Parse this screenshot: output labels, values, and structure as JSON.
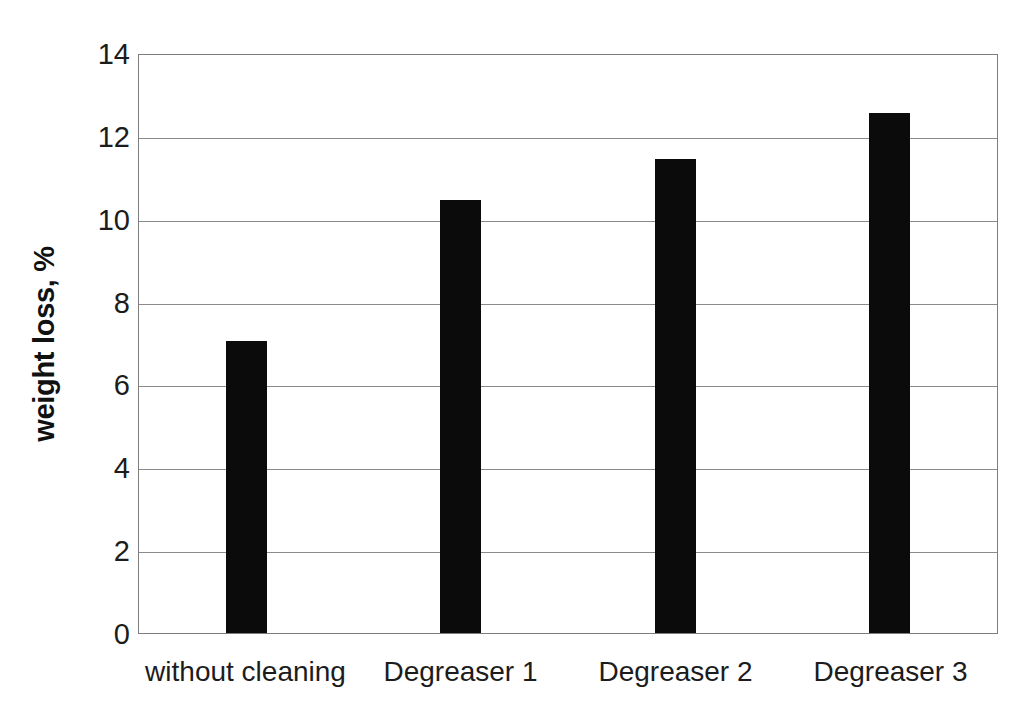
{
  "chart_data": {
    "type": "bar",
    "title": "",
    "subtitle": "",
    "xlabel": "",
    "ylabel": "weight loss, %",
    "categories": [
      "without cleaning",
      "Degreaser 1",
      "Degreaser 2",
      "Degreaser 3"
    ],
    "values": [
      7.05,
      10.45,
      11.45,
      12.55
    ],
    "ylim": [
      0,
      14
    ],
    "ytick_labels": [
      "0",
      "2",
      "4",
      "6",
      "8",
      "10",
      "12",
      "14"
    ],
    "ytick_values": [
      0,
      2,
      4,
      6,
      8,
      10,
      12,
      14
    ],
    "grid": "horizontal",
    "legend": "none",
    "bar_color": "#0b0b0b",
    "gridline_color": "#8a8a8a",
    "axis_color": "#7d7d7d",
    "background_color": "#ffffff",
    "text_color": "#1c1c1c"
  }
}
